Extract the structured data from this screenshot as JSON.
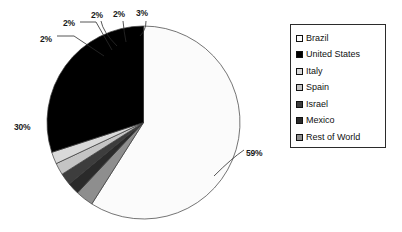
{
  "chart_data": {
    "type": "pie",
    "title": "",
    "labels": [
      "Brazil",
      "United States",
      "Italy",
      "Spain",
      "Israel",
      "Mexico",
      "Rest of World"
    ],
    "values": [
      59,
      30,
      2,
      2,
      2,
      2,
      3
    ],
    "value_labels": [
      "59%",
      "30%",
      "2%",
      "2%",
      "2%",
      "2%",
      "3%"
    ],
    "colors": [
      "#fbfbfb",
      "#000000",
      "#d9d9d9",
      "#c4c4c4",
      "#3d3d3d",
      "#2a2a2a",
      "#8e8e8e"
    ],
    "units": "percent",
    "start_angle_deg": 0,
    "direction": "clockwise",
    "legend_position": "right",
    "grid": false,
    "slices": [
      {
        "label": "Brazil",
        "value": 59,
        "value_label": "59%",
        "color": "#fbfbfb"
      },
      {
        "label": "Rest of World",
        "value": 3,
        "value_label": "3%",
        "color": "#8e8e8e"
      },
      {
        "label": "Mexico",
        "value": 2,
        "value_label": "2%",
        "color": "#2a2a2a"
      },
      {
        "label": "Israel",
        "value": 2,
        "value_label": "2%",
        "color": "#3d3d3d"
      },
      {
        "label": "Spain",
        "value": 2,
        "value_label": "2%",
        "color": "#c4c4c4"
      },
      {
        "label": "Italy",
        "value": 2,
        "value_label": "2%",
        "color": "#d9d9d9"
      },
      {
        "label": "United States",
        "value": 30,
        "value_label": "30%",
        "color": "#000000"
      }
    ]
  },
  "legend": {
    "items": [
      {
        "label": "Brazil",
        "color": "#fbfbfb"
      },
      {
        "label": "United States",
        "color": "#000000"
      },
      {
        "label": "Italy",
        "color": "#d9d9d9"
      },
      {
        "label": "Spain",
        "color": "#c4c4c4"
      },
      {
        "label": "Israel",
        "color": "#3d3d3d"
      },
      {
        "label": "Mexico",
        "color": "#2a2a2a"
      },
      {
        "label": "Rest of World",
        "color": "#8e8e8e"
      }
    ]
  },
  "callouts": [
    {
      "text": "2%",
      "x": 40,
      "y": 34
    },
    {
      "text": "2%",
      "x": 63,
      "y": 18
    },
    {
      "text": "2%",
      "x": 91,
      "y": 10
    },
    {
      "text": "2%",
      "x": 113,
      "y": 9
    },
    {
      "text": "3%",
      "x": 136,
      "y": 8
    },
    {
      "text": "30%",
      "x": 14,
      "y": 122
    },
    {
      "text": "59%",
      "x": 246,
      "y": 148
    }
  ]
}
